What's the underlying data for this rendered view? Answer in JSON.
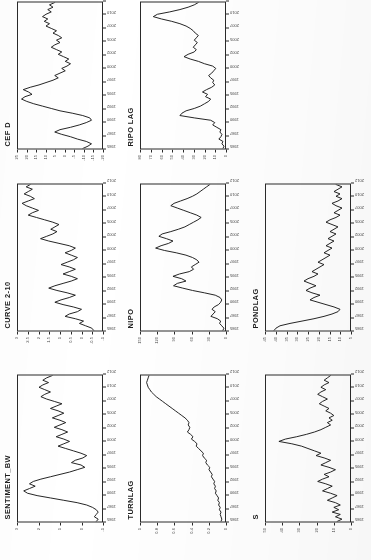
{
  "page": {
    "kind": "scanned-figure-page",
    "layout": "3x3 grid of rotated time-series panels, top-right cell empty",
    "rotation": "panels rendered rotated 90 degrees counter-clockwise",
    "ink_color": "#1a1a1a",
    "paper_color": "#ffffff"
  },
  "chart_data": [
    {
      "type": "line",
      "title": "CEF D",
      "xlabel": "",
      "ylabel": "",
      "grid": false,
      "legend": "none",
      "x": [
        "1985",
        "1990",
        "1995",
        "2000",
        "2005",
        "2010",
        "2015",
        "2020"
      ],
      "xticklabels": [
        "1985",
        "1987",
        "1990",
        "1992",
        "1995",
        "1997",
        "2000",
        "2002",
        "2005",
        "2007",
        "2010",
        "2012"
      ],
      "yticklabels": [
        "25",
        "20",
        "15",
        "10",
        "5",
        "0",
        "-5",
        "-10",
        "-15",
        "-20"
      ],
      "ylim": [
        -20,
        28
      ],
      "values": [
        -9,
        -12,
        -14,
        -11,
        -6,
        -2,
        3,
        7,
        4,
        -2,
        -7,
        -11,
        -14,
        -13,
        -9,
        -3,
        4,
        9,
        14,
        19,
        23,
        26,
        24,
        20,
        22,
        25,
        21,
        16,
        12,
        8,
        5,
        7,
        4,
        1,
        3,
        0,
        -2,
        1,
        -1,
        2,
        5,
        3,
        6,
        9,
        7,
        4,
        6,
        3,
        5,
        8,
        6,
        9,
        12,
        10,
        13,
        11,
        14,
        12,
        9,
        11,
        8,
        10,
        7
      ]
    },
    {
      "type": "line",
      "title": "RIPO LAG",
      "xlabel": "",
      "ylabel": "",
      "grid": false,
      "legend": "none",
      "xticklabels": [
        "1985",
        "1987",
        "1990",
        "1992",
        "1995",
        "1997",
        "2000",
        "2002",
        "2005",
        "2007",
        "2010",
        "2012"
      ],
      "yticklabels": [
        "80",
        "70",
        "60",
        "50",
        "40",
        "30",
        "20",
        "10",
        "0"
      ],
      "ylim": [
        0,
        82
      ],
      "values": [
        2,
        1,
        3,
        2,
        6,
        4,
        3,
        5,
        4,
        8,
        12,
        10,
        14,
        30,
        44,
        42,
        38,
        30,
        24,
        20,
        16,
        14,
        19,
        17,
        22,
        18,
        13,
        10,
        12,
        11,
        14,
        16,
        13,
        11,
        9,
        12,
        20,
        26,
        34,
        40,
        36,
        30,
        28,
        31,
        29,
        27,
        30,
        28,
        26,
        29,
        31,
        34,
        38,
        44,
        52,
        62,
        70,
        66,
        54,
        44,
        36,
        30,
        26
      ]
    },
    {
      "type": "line",
      "title": "CURVE 2-10",
      "xlabel": "",
      "ylabel": "",
      "grid": false,
      "legend": "none",
      "xticklabels": [
        "1985",
        "1987",
        "1990",
        "1992",
        "1995",
        "1997",
        "2000",
        "2002",
        "2005",
        "2007",
        "2010",
        "2012"
      ],
      "yticklabels": [
        "3",
        "2.5",
        "2",
        "1.5",
        "1",
        "0.5",
        "0",
        "-0.5",
        "-1"
      ],
      "ylim": [
        -1,
        3.1
      ],
      "values": [
        -0.6,
        -0.5,
        -0.2,
        0.1,
        -0.1,
        0.3,
        0.8,
        0.6,
        0.2,
        0.0,
        0.4,
        0.9,
        1.3,
        1.0,
        0.6,
        0.3,
        0.7,
        1.2,
        1.6,
        1.3,
        0.9,
        0.5,
        0.2,
        0.5,
        0.9,
        0.6,
        0.3,
        0.6,
        1.0,
        0.7,
        0.4,
        0.2,
        0.5,
        0.8,
        0.5,
        0.3,
        0.6,
        1.1,
        1.6,
        2.0,
        1.7,
        1.4,
        1.2,
        1.5,
        1.3,
        1.1,
        1.4,
        1.8,
        2.2,
        2.6,
        2.4,
        2.1,
        2.4,
        2.7,
        2.9,
        2.6,
        2.3,
        2.5,
        2.8,
        2.6,
        2.4,
        2.7,
        2.5
      ]
    },
    {
      "type": "line",
      "title": "NIPO",
      "xlabel": "",
      "ylabel": "",
      "grid": false,
      "legend": "none",
      "xticklabels": [
        "1985",
        "1987",
        "1990",
        "1992",
        "1995",
        "1997",
        "2000",
        "2002",
        "2005",
        "2007",
        "2010",
        "2012"
      ],
      "yticklabels": [
        "150",
        "120",
        "90",
        "60",
        "30",
        "0"
      ],
      "ylim": [
        0,
        155
      ],
      "values": [
        4,
        2,
        6,
        10,
        8,
        14,
        26,
        22,
        18,
        24,
        20,
        12,
        8,
        6,
        9,
        18,
        38,
        60,
        78,
        95,
        88,
        72,
        80,
        96,
        84,
        66,
        58,
        62,
        55,
        48,
        52,
        60,
        72,
        90,
        112,
        128,
        118,
        104,
        96,
        108,
        122,
        116,
        100,
        86,
        74,
        66,
        58,
        50,
        44,
        52,
        64,
        76,
        88,
        100,
        94,
        82,
        70,
        60,
        52,
        46,
        40,
        34,
        28
      ]
    },
    {
      "type": "line",
      "title": "PONDLAG",
      "xlabel": "",
      "ylabel": "",
      "grid": false,
      "legend": "none",
      "xticklabels": [
        "1985",
        "1987",
        "1990",
        "1992",
        "1995",
        "1997",
        "2000",
        "2002",
        "2005",
        "2007",
        "2010",
        "2012"
      ],
      "yticklabels": [
        "45",
        "40",
        "35",
        "30",
        "25",
        "20",
        "15",
        "10",
        "5"
      ],
      "ylim": [
        4,
        46
      ],
      "values": [
        42,
        41,
        39,
        34,
        28,
        22,
        17,
        13,
        10,
        9,
        12,
        16,
        20,
        24,
        22,
        19,
        23,
        26,
        24,
        21,
        24,
        27,
        25,
        22,
        20,
        23,
        21,
        19,
        17,
        20,
        18,
        16,
        14,
        17,
        15,
        13,
        16,
        14,
        12,
        15,
        13,
        11,
        14,
        12,
        10,
        13,
        16,
        14,
        11,
        9,
        12,
        10,
        8,
        11,
        13,
        10,
        8,
        11,
        9,
        12,
        10,
        8,
        11
      ]
    },
    {
      "type": "line",
      "title": "SENTIMENT_BW",
      "xlabel": "",
      "ylabel": "",
      "grid": false,
      "legend": "none",
      "xticklabels": [
        "1985",
        "1987",
        "1990",
        "1992",
        "1995",
        "1997",
        "2000",
        "2002",
        "2005",
        "2007",
        "2010",
        "2012"
      ],
      "yticklabels": [
        "3",
        "2",
        "1",
        "0",
        "-1"
      ],
      "ylim": [
        -1.2,
        3.2
      ],
      "values": [
        -0.9,
        -1.0,
        -0.8,
        -0.9,
        -1.0,
        -0.9,
        -0.7,
        -0.4,
        0.1,
        0.8,
        1.5,
        2.2,
        2.7,
        2.9,
        2.6,
        2.3,
        2.6,
        2.4,
        2.0,
        1.5,
        1.0,
        0.5,
        0.1,
        -0.3,
        -0.1,
        0.4,
        0.2,
        -0.2,
        -0.4,
        -0.1,
        0.3,
        0.7,
        1.1,
        0.8,
        0.5,
        0.8,
        1.2,
        0.9,
        0.6,
        0.9,
        1.3,
        1.0,
        0.7,
        1.0,
        1.4,
        1.1,
        0.8,
        1.1,
        1.5,
        1.2,
        0.9,
        1.3,
        1.7,
        2.0,
        1.8,
        1.5,
        1.8,
        2.1,
        1.9,
        1.6,
        1.9,
        1.7,
        1.4
      ]
    },
    {
      "type": "line",
      "title": "TURNLAG",
      "xlabel": "",
      "ylabel": "",
      "grid": false,
      "legend": "none",
      "xticklabels": [
        "1985",
        "1987",
        "1990",
        "1992",
        "1995",
        "1997",
        "2000",
        "2002",
        "2005",
        "2007",
        "2010",
        "2012"
      ],
      "yticklabels": [
        "1",
        "0.8",
        "0.6",
        "0.4",
        "0.2",
        "0"
      ],
      "ylim": [
        0,
        1.05
      ],
      "values": [
        0.05,
        0.04,
        0.05,
        0.06,
        0.05,
        0.07,
        0.06,
        0.08,
        0.07,
        0.09,
        0.08,
        0.1,
        0.12,
        0.11,
        0.13,
        0.12,
        0.14,
        0.13,
        0.15,
        0.17,
        0.16,
        0.18,
        0.2,
        0.19,
        0.22,
        0.24,
        0.23,
        0.26,
        0.28,
        0.27,
        0.3,
        0.33,
        0.36,
        0.35,
        0.38,
        0.42,
        0.4,
        0.43,
        0.47,
        0.45,
        0.44,
        0.46,
        0.45,
        0.47,
        0.5,
        0.54,
        0.58,
        0.62,
        0.66,
        0.7,
        0.74,
        0.78,
        0.82,
        0.86,
        0.89,
        0.92,
        0.94,
        0.96,
        0.97,
        0.98,
        0.97,
        0.96,
        0.95
      ]
    },
    {
      "type": "line",
      "title": "S",
      "xlabel": "",
      "ylabel": "",
      "grid": false,
      "legend": "none",
      "xticklabels": [
        "1985",
        "1987",
        "1990",
        "1992",
        "1995",
        "1997",
        "2000",
        "2002",
        "2005",
        "2007",
        "2010",
        "2012"
      ],
      "yticklabels": [
        "50",
        "40",
        "30",
        "20",
        "10",
        "0"
      ],
      "ylim": [
        0,
        52
      ],
      "values": [
        8,
        5,
        9,
        6,
        11,
        7,
        10,
        6,
        9,
        14,
        11,
        8,
        12,
        17,
        14,
        11,
        15,
        20,
        17,
        13,
        16,
        12,
        9,
        13,
        18,
        15,
        12,
        16,
        21,
        18,
        22,
        26,
        30,
        36,
        44,
        40,
        33,
        27,
        22,
        18,
        15,
        12,
        14,
        11,
        13,
        10,
        12,
        15,
        13,
        16,
        19,
        17,
        14,
        17,
        20,
        18,
        15,
        18,
        16,
        13,
        16,
        14,
        12
      ]
    }
  ]
}
